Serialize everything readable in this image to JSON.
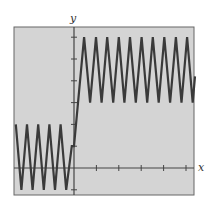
{
  "chart_data": {
    "type": "line",
    "title": "",
    "xlabel": "x",
    "ylabel": "y",
    "grid": false,
    "legend": null,
    "xlim": [
      -2.6,
      5.4
    ],
    "ylim": [
      -1.2,
      6.5
    ],
    "x_ticks": [
      1,
      2,
      3,
      4,
      5
    ],
    "y_ticks": [
      -1,
      1,
      2,
      3,
      4,
      5,
      6
    ],
    "tick_labels_shown": false,
    "series": [
      {
        "name": "f(x)",
        "description": "Sawtooth (zigzag) oscillation between y=-1 and y=2 for x<0, then rises steeply to oscillate between y=3 and y=6 for x>0",
        "x": [
          -2.6,
          -2.35,
          -2.1,
          -1.85,
          -1.6,
          -1.35,
          -1.1,
          -0.85,
          -0.6,
          -0.35,
          -0.1,
          0.0,
          0.45,
          0.72,
          0.98,
          1.23,
          1.48,
          1.75,
          2.0,
          2.25,
          2.5,
          2.76,
          3.02,
          3.27,
          3.52,
          3.78,
          4.03,
          4.29,
          4.55,
          4.8,
          5.05,
          5.3,
          5.4
        ],
        "y": [
          2,
          -1,
          2,
          -1,
          2,
          -1,
          2,
          -1,
          2,
          -1,
          1.0,
          1.0,
          6,
          3,
          6,
          3,
          6,
          3,
          6,
          3,
          6,
          3,
          6,
          3,
          6,
          3,
          6,
          3,
          6,
          3,
          6,
          3,
          4.2
        ]
      }
    ]
  },
  "axes": {
    "x_label": "x",
    "y_label": "y"
  },
  "style": {
    "plot_bg": "#d4d4d4",
    "line_color": "#3a3a3a",
    "axis_color": "#444444"
  }
}
